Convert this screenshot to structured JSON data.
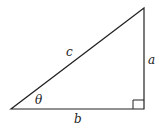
{
  "diagram": {
    "type": "right-triangle",
    "labels": {
      "hypotenuse": "c",
      "opposite": "a",
      "adjacent": "b",
      "angle": "θ"
    },
    "colors": {
      "stroke": "#222222",
      "background": "#ffffff"
    }
  }
}
